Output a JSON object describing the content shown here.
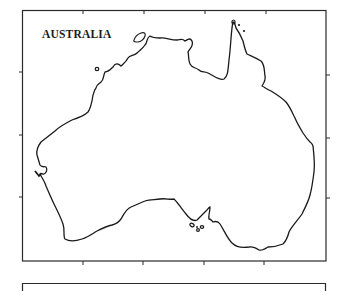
{
  "map": {
    "title": "AUSTRALIA",
    "colors": {
      "background": "#ffffff",
      "outline": "#1a1a1a",
      "frame": "#2a2a2a"
    },
    "frame": {
      "ticks_top": 4,
      "ticks_bottom": 4,
      "ticks_left": 3,
      "ticks_right": 3
    },
    "features": [
      "mainland-coastline",
      "melville-island",
      "kangaroo-island",
      "torres-strait-islands",
      "small-island-kimberley"
    ]
  },
  "lower_panel": {
    "visible": "partial"
  }
}
